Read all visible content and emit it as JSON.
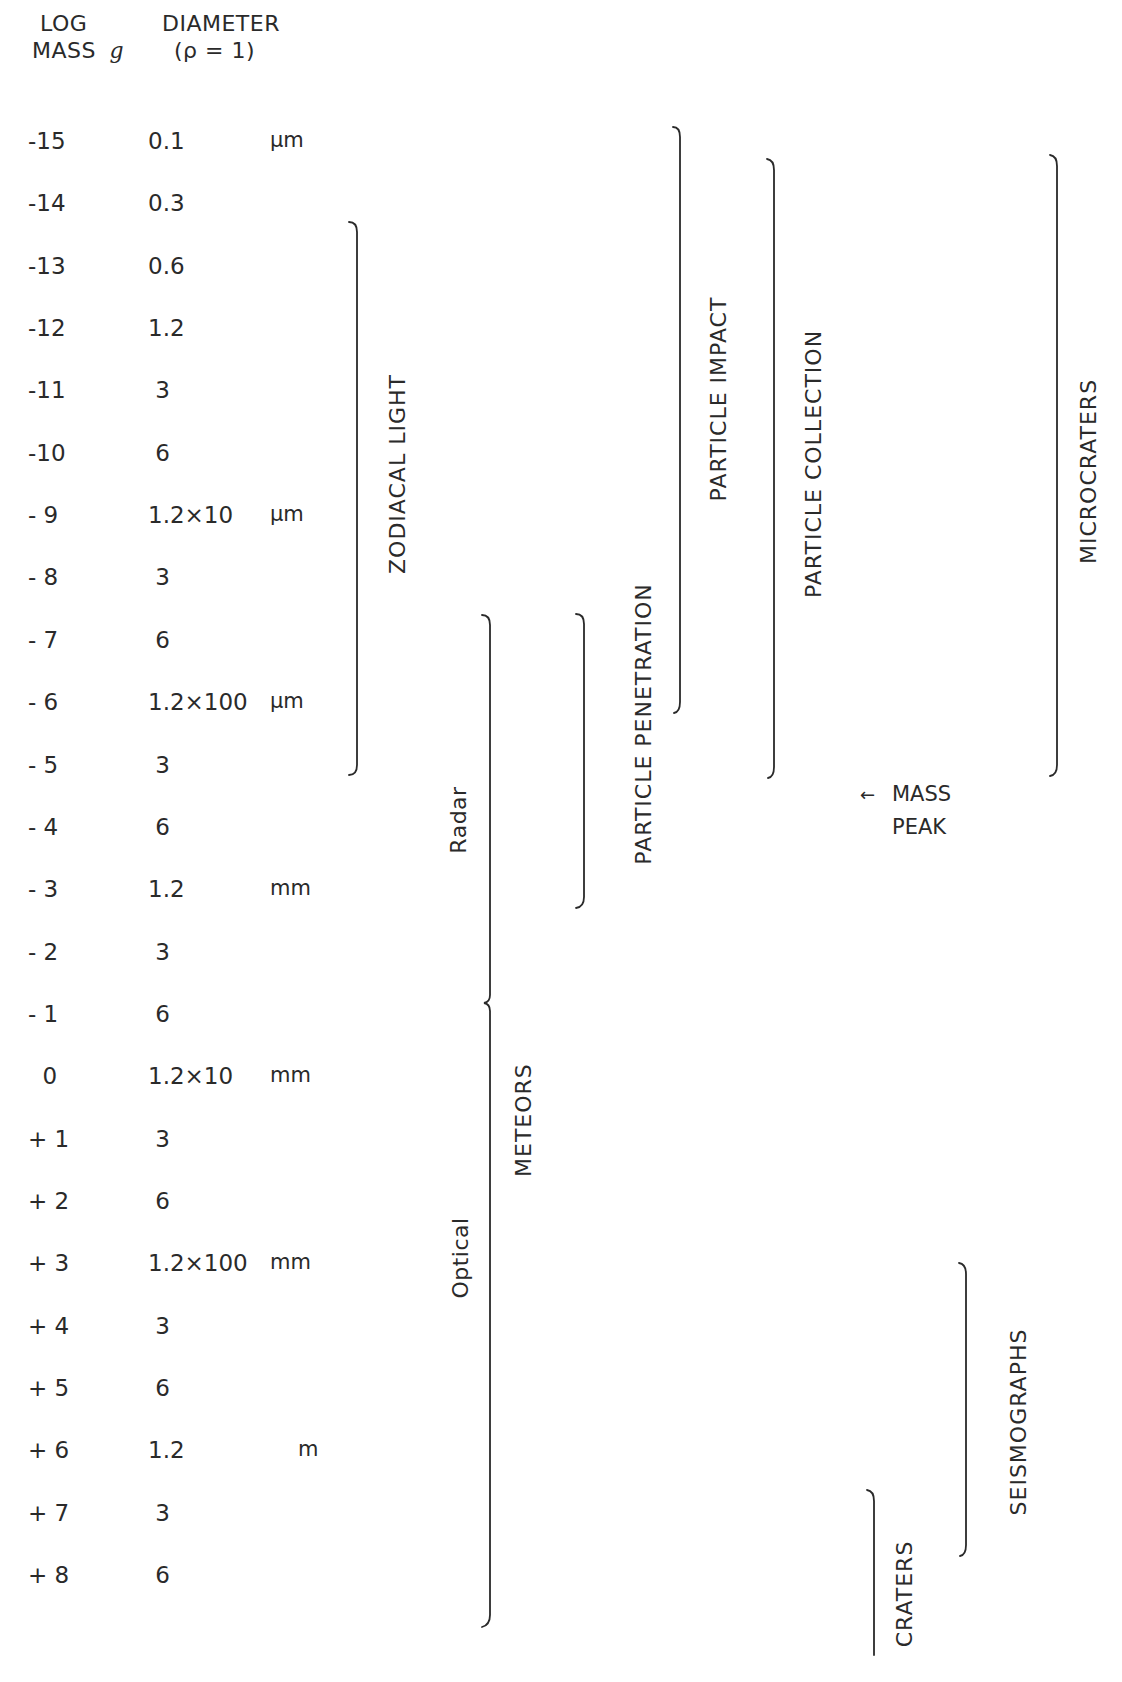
{
  "header": {
    "mass_line1": "LOG",
    "mass_line2": "MASS",
    "mass_unit": "g",
    "diameter_line1": "DIAMETER",
    "diameter_line2": "(ρ = 1)"
  },
  "rows": [
    {
      "log_mass": "-15",
      "diameter": "0.1",
      "unit": "μm"
    },
    {
      "log_mass": "-14",
      "diameter": "0.3",
      "unit": ""
    },
    {
      "log_mass": "-13",
      "diameter": "0.6",
      "unit": ""
    },
    {
      "log_mass": "-12",
      "diameter": "1.2",
      "unit": ""
    },
    {
      "log_mass": "-11",
      "diameter": " 3",
      "unit": ""
    },
    {
      "log_mass": "-10",
      "diameter": " 6",
      "unit": ""
    },
    {
      "log_mass": "- 9",
      "diameter": "1.2×10",
      "unit": "μm"
    },
    {
      "log_mass": "- 8",
      "diameter": " 3",
      "unit": ""
    },
    {
      "log_mass": "- 7",
      "diameter": " 6",
      "unit": ""
    },
    {
      "log_mass": "- 6",
      "diameter": "1.2×100",
      "unit": "μm"
    },
    {
      "log_mass": "- 5",
      "diameter": " 3",
      "unit": ""
    },
    {
      "log_mass": "- 4",
      "diameter": " 6",
      "unit": ""
    },
    {
      "log_mass": "- 3",
      "diameter": "1.2",
      "unit": "mm"
    },
    {
      "log_mass": "- 2",
      "diameter": " 3",
      "unit": ""
    },
    {
      "log_mass": "- 1",
      "diameter": " 6",
      "unit": ""
    },
    {
      "log_mass": "  0",
      "diameter": "1.2×10",
      "unit": "mm"
    },
    {
      "log_mass": "+ 1",
      "diameter": " 3",
      "unit": ""
    },
    {
      "log_mass": "+ 2",
      "diameter": " 6",
      "unit": ""
    },
    {
      "log_mass": "+ 3",
      "diameter": "1.2×100",
      "unit": "mm"
    },
    {
      "log_mass": "+ 4",
      "diameter": " 3",
      "unit": ""
    },
    {
      "log_mass": "+ 5",
      "diameter": " 6",
      "unit": ""
    },
    {
      "log_mass": "+ 6",
      "diameter": "1.2",
      "unit": "m"
    },
    {
      "log_mass": "+ 7",
      "diameter": " 3",
      "unit": ""
    },
    {
      "log_mass": "+ 8",
      "diameter": " 6",
      "unit": ""
    }
  ],
  "ranges": [
    {
      "label": "ZODIACAL LIGHT",
      "from_log_mass": -13,
      "to_log_mass": -6
    },
    {
      "label": "Radar",
      "from_log_mass": -7,
      "to_log_mass": -1.5
    },
    {
      "label": "Optical",
      "from_log_mass": -1.5,
      "to_log_mass": 7.5
    },
    {
      "label": "METEORS",
      "from_log_mass": -7,
      "to_log_mass": 7.5
    },
    {
      "label": "PARTICLE PENETRATION",
      "from_log_mass": -7,
      "to_log_mass": -4
    },
    {
      "label": "PARTICLE IMPACT",
      "from_log_mass": -15,
      "to_log_mass": -6.5
    },
    {
      "label": "PARTICLE COLLECTION",
      "from_log_mass": -15,
      "to_log_mass": -6
    },
    {
      "label": "MICROCRATERS",
      "from_log_mass": -15,
      "to_log_mass": -6
    },
    {
      "label": "SEISMOGRAPHS",
      "from_log_mass": 3,
      "to_log_mass": 7
    },
    {
      "label": "CRATERS",
      "from_log_mass": 6,
      "to_log_mass": 8
    }
  ],
  "annotation": {
    "arrow": "←",
    "line1": "MASS",
    "line2": "PEAK"
  }
}
